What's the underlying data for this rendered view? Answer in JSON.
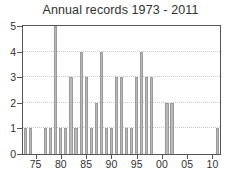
{
  "chart_data": {
    "type": "bar",
    "title": "Annual records 1973 - 2011",
    "xlabel": "",
    "ylabel": "",
    "xlim": [
      1972.5,
      2011.5
    ],
    "ylim": [
      0,
      5
    ],
    "grid": true,
    "legend": null,
    "categories": [
      "1973",
      "1974",
      "1975",
      "1976",
      "1977",
      "1978",
      "1979",
      "1980",
      "1981",
      "1982",
      "1983",
      "1984",
      "1985",
      "1986",
      "1987",
      "1988",
      "1989",
      "1990",
      "1991",
      "1992",
      "1993",
      "1994",
      "1995",
      "1996",
      "1997",
      "1998",
      "1999",
      "2000",
      "2001",
      "2002",
      "2003",
      "2004",
      "2005",
      "2006",
      "2007",
      "2008",
      "2009",
      "2010",
      "2011"
    ],
    "values": [
      1,
      1,
      0,
      0,
      1,
      1,
      5,
      1,
      1,
      3,
      1,
      4,
      3,
      1,
      2,
      4,
      1,
      1,
      3,
      3,
      1,
      1,
      3,
      4,
      3,
      3,
      0,
      0,
      2,
      2,
      0,
      0,
      0,
      0,
      0,
      0,
      0,
      0,
      1
    ],
    "ytick_labels": [
      "0",
      "1",
      "2",
      "3",
      "4",
      "5"
    ],
    "ytick_values": [
      0,
      1,
      2,
      3,
      4,
      5
    ],
    "xtick_labels": [
      "75",
      "80",
      "85",
      "90",
      "95",
      "00",
      "05",
      "10"
    ],
    "xtick_values": [
      1975,
      1980,
      1985,
      1990,
      1995,
      2000,
      2005,
      2010
    ],
    "bar_color": "#b9b9b9",
    "bar_edge_color": "#9a9a9a",
    "axis_color": "#555555",
    "grid_color": "#c9c9c9",
    "text_color": "#303030",
    "background": "#ffffff"
  }
}
